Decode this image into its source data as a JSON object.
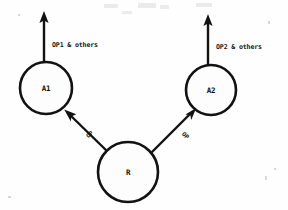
{
  "diagram": {
    "stroke_color": "#121212",
    "background_color": "#fefefe",
    "nodes": [
      {
        "id": "A1",
        "label": "A1",
        "cx": 46,
        "cy": 88,
        "r": 26
      },
      {
        "id": "A2",
        "label": "A2",
        "cx": 211,
        "cy": 90,
        "r": 25
      },
      {
        "id": "R",
        "label": "R",
        "cx": 128,
        "cy": 172,
        "r": 30
      }
    ],
    "edges": [
      {
        "id": "r-to-a1",
        "label": "OP",
        "from": "R",
        "to": "A1",
        "label_x": 91,
        "label_y": 136,
        "label_rotation": -42
      },
      {
        "id": "r-to-a2",
        "label": "OP",
        "from": "R",
        "to": "A2",
        "label_x": 184,
        "label_y": 137,
        "label_rotation": 44
      }
    ],
    "outputs": [
      {
        "id": "a1-output",
        "label": "OP1 & others",
        "arrow_x": 44,
        "arrow_tip_y": 12,
        "arrow_base_y": 62,
        "label_x": 52,
        "label_y": 47
      },
      {
        "id": "a2-output",
        "label": "OP2 & others",
        "arrow_x": 208,
        "arrow_tip_y": 15,
        "arrow_base_y": 65,
        "label_x": 216,
        "label_y": 49
      }
    ]
  }
}
